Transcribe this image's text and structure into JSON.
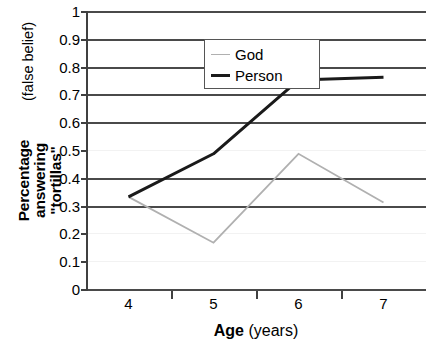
{
  "chart_data": {
    "type": "line",
    "title": "",
    "xlabel_bold": "Age",
    "xlabel_rest": " (years)",
    "ylabel_main": "Percentage answering\n\"tortillas\"",
    "ylabel_sub": "(false belief)",
    "categories": [
      "4",
      "5",
      "6",
      "7"
    ],
    "x": [
      4,
      5,
      6,
      7
    ],
    "ylim": [
      0,
      1
    ],
    "yticks": [
      "0",
      "0.1",
      "0.2",
      "0.3",
      "0.4",
      "0.5",
      "0.6",
      "0.7",
      "0.8",
      "0.9",
      "1"
    ],
    "ytick_values": [
      0,
      0.1,
      0.2,
      0.3,
      0.4,
      0.5,
      0.6,
      0.7,
      0.8,
      0.9,
      1
    ],
    "grid": true,
    "legend_position": "upper-left-inside",
    "series": [
      {
        "name": "God",
        "color": "#b0b0b0",
        "width": 1.8,
        "values": [
          0.335,
          0.17,
          0.49,
          0.315
        ]
      },
      {
        "name": "Person",
        "color": "#1a1a1a",
        "width": 3.0,
        "values": [
          0.335,
          0.49,
          0.755,
          0.765
        ]
      }
    ]
  },
  "legend": {
    "items": [
      {
        "label": "God",
        "swatch": "god"
      },
      {
        "label": "Person",
        "swatch": "person"
      }
    ]
  },
  "axis": {
    "gridline_values": [
      1,
      0.9,
      0.8,
      0.7,
      0.6,
      0.4,
      0.3,
      0
    ],
    "faint_gridline_values": [
      0.5,
      0.2,
      0.1
    ]
  }
}
